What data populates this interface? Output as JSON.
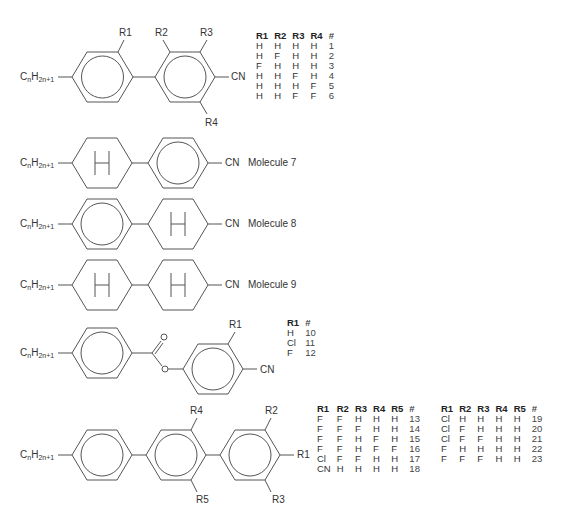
{
  "chain_label": {
    "base": "C",
    "n": "n",
    "h": "H",
    "sub": "2n+1"
  },
  "molecules_1_6": {
    "substituents": [
      "R1",
      "R2",
      "R3",
      "R4"
    ],
    "terminal": "CN",
    "table": {
      "headers": [
        "R1",
        "R2",
        "R3",
        "R4",
        "#"
      ],
      "rows": [
        [
          "H",
          "H",
          "H",
          "H",
          "1"
        ],
        [
          "H",
          "F",
          "H",
          "H",
          "2"
        ],
        [
          "F",
          "H",
          "H",
          "H",
          "3"
        ],
        [
          "H",
          "H",
          "F",
          "H",
          "4"
        ],
        [
          "H",
          "H",
          "H",
          "F",
          "5"
        ],
        [
          "H",
          "H",
          "F",
          "F",
          "6"
        ]
      ]
    }
  },
  "molecule_7": {
    "terminal": "CN",
    "name": "Molecule 7",
    "ring_label": "H"
  },
  "molecule_8": {
    "terminal": "CN",
    "name": "Molecule 8",
    "ring_label": "H"
  },
  "molecule_9": {
    "terminal": "CN",
    "name": "Molecule 9",
    "ring_label": "H"
  },
  "molecules_10_12": {
    "substituents": [
      "R1"
    ],
    "terminal": "CN",
    "table": {
      "headers": [
        "R1",
        "#"
      ],
      "rows": [
        [
          "H",
          "10"
        ],
        [
          "Cl",
          "11"
        ],
        [
          "F",
          "12"
        ]
      ]
    }
  },
  "molecules_13_23": {
    "substituents": [
      "R1",
      "R2",
      "R3",
      "R4",
      "R5"
    ],
    "table_a": {
      "headers": [
        "R1",
        "R2",
        "R3",
        "R4",
        "R5",
        "#"
      ],
      "rows": [
        [
          "F",
          "F",
          "H",
          "H",
          "H",
          "13"
        ],
        [
          "F",
          "F",
          "F",
          "H",
          "H",
          "14"
        ],
        [
          "F",
          "F",
          "H",
          "F",
          "H",
          "15"
        ],
        [
          "F",
          "F",
          "H",
          "F",
          "F",
          "16"
        ],
        [
          "Cl",
          "F",
          "F",
          "H",
          "H",
          "17"
        ],
        [
          "CN",
          "H",
          "H",
          "H",
          "H",
          "18"
        ]
      ]
    },
    "table_b": {
      "headers": [
        "R1",
        "R2",
        "R3",
        "R4",
        "R5",
        "#"
      ],
      "rows": [
        [
          "Cl",
          "H",
          "H",
          "H",
          "H",
          "19"
        ],
        [
          "Cl",
          "F",
          "H",
          "H",
          "H",
          "20"
        ],
        [
          "Cl",
          "F",
          "F",
          "H",
          "H",
          "21"
        ],
        [
          "F",
          "H",
          "H",
          "H",
          "H",
          "22"
        ],
        [
          "F",
          "F",
          "F",
          "H",
          "H",
          "23"
        ]
      ]
    }
  }
}
